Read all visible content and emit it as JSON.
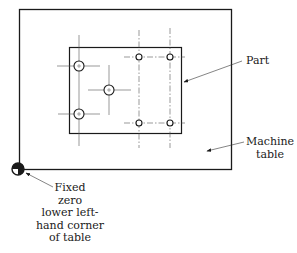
{
  "diagram": {
    "type": "machining-fixture-layout",
    "colors": {
      "line": "#1a1a1a",
      "centerline": "#555555",
      "background": "#ffffff"
    },
    "machine_table": {
      "x": 19,
      "y": 9,
      "w": 212,
      "h": 160
    },
    "part": {
      "x": 69,
      "y": 47,
      "w": 112,
      "h": 86
    },
    "holes": [
      {
        "cx": 79,
        "cy": 66,
        "r": 5,
        "size": "large"
      },
      {
        "cx": 109,
        "cy": 90,
        "r": 5,
        "size": "large"
      },
      {
        "cx": 79,
        "cy": 114,
        "r": 5,
        "size": "large"
      },
      {
        "cx": 139,
        "cy": 57,
        "r": 3,
        "size": "small"
      },
      {
        "cx": 170,
        "cy": 57,
        "r": 3,
        "size": "small"
      },
      {
        "cx": 139,
        "cy": 123,
        "r": 3,
        "size": "small"
      },
      {
        "cx": 170,
        "cy": 123,
        "r": 3,
        "size": "small"
      }
    ],
    "labels": {
      "part": "Part",
      "machine_table_line1": "Machine",
      "machine_table_line2": "table",
      "fixed_zero_line1": "Fixed",
      "fixed_zero_line2": "zero",
      "fixed_zero_line3": "lower left-",
      "fixed_zero_line4": "hand corner",
      "fixed_zero_line5": "of table"
    }
  }
}
